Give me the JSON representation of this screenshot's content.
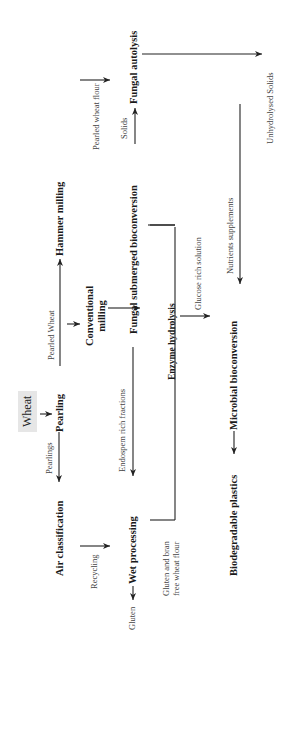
{
  "diagram": {
    "start": "Wheat",
    "nodes": {
      "pearling": "Pearling",
      "air_classification": "Air classification",
      "wet_processing": "Wet processing",
      "conventional_milling_1": "Conventional",
      "conventional_milling_2": "milling",
      "hammer_milling": "Hammer milling",
      "fungal_submerged": "Fungal submerged bioconversion",
      "fungal_autolysis": "Fungal autolysis",
      "enzyme_hydrolysis": "Enzyme hydrolysis",
      "microbial_bioconversion": "Microbial bioconversion",
      "biodegradable_plastics": "Biodegradable plastics"
    },
    "edge_labels": {
      "pearlings": "Pearlings",
      "recycling": "Recycling",
      "gluten": "Gluten",
      "pearled_wheat": "Pearled Wheat",
      "endosperm": "Endospem rich fractions",
      "gluten_bran_1": "Gluten and bran",
      "gluten_bran_2": "free wheat flour",
      "pearled_wheat_flour": "Pearled wheat flour",
      "solids": "Solids",
      "glucose": "Glucose rich solution",
      "nutrients": "Nutrients supplements",
      "unhydrolysed": "Unhydrolysed Solids"
    }
  }
}
